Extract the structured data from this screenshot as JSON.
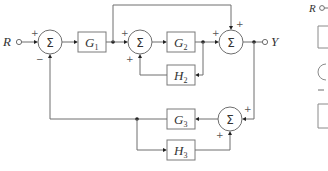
{
  "diagram": {
    "type": "block-diagram",
    "input": {
      "label": "R"
    },
    "output": {
      "label": "Y"
    },
    "summing_symbol": "Σ",
    "blocks": [
      {
        "id": "G1",
        "base": "G",
        "sub": "1"
      },
      {
        "id": "G2",
        "base": "G",
        "sub": "2"
      },
      {
        "id": "H2",
        "base": "H",
        "sub": "2"
      },
      {
        "id": "G3",
        "base": "G",
        "sub": "3"
      },
      {
        "id": "H3",
        "base": "H",
        "sub": "3"
      }
    ],
    "summers": [
      {
        "id": "S1",
        "signs": [
          "+",
          "−"
        ]
      },
      {
        "id": "S2",
        "signs": [
          "+",
          "+"
        ]
      },
      {
        "id": "S3",
        "signs": [
          "+",
          "+"
        ]
      },
      {
        "id": "S4",
        "signs": [
          "+",
          "+"
        ]
      }
    ],
    "partial_next_figure": {
      "label": "R"
    }
  }
}
